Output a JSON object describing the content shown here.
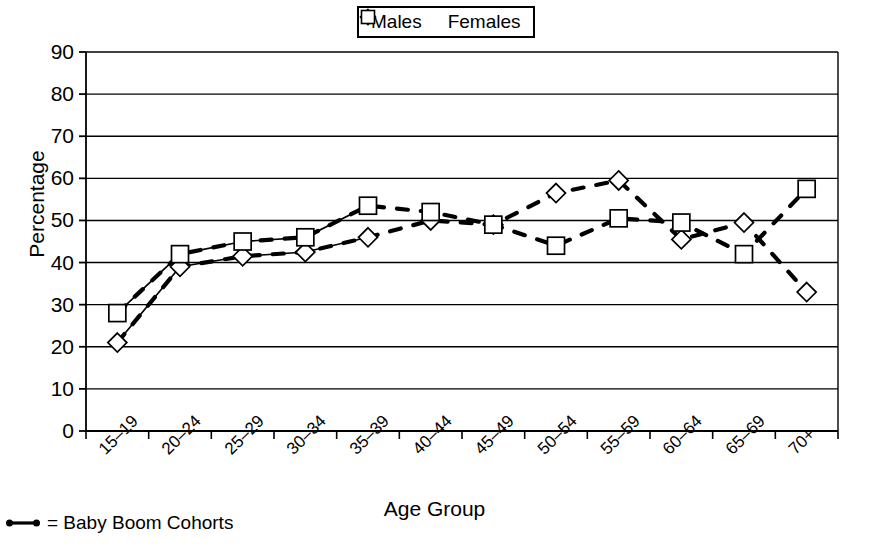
{
  "chart_data": {
    "type": "line",
    "title": "",
    "xlabel": "Age Group",
    "ylabel": "Percentage",
    "ylim": [
      0,
      90
    ],
    "yticks": [
      0,
      10,
      20,
      30,
      40,
      50,
      60,
      70,
      80,
      90
    ],
    "grid": true,
    "legend_position": "top-center",
    "categories": [
      "15–19",
      "20–24",
      "25–29",
      "30–34",
      "35–39",
      "40–44",
      "45–49",
      "50–54",
      "55–59",
      "60–64",
      "65–69",
      "70+"
    ],
    "series": [
      {
        "name": "Males",
        "marker": "diamond",
        "values": [
          21,
          39,
          41.5,
          42.5,
          46,
          50,
          49,
          56.5,
          59.5,
          45.5,
          49.5,
          33
        ]
      },
      {
        "name": "Females",
        "marker": "square",
        "values": [
          28,
          42,
          45,
          46,
          53.5,
          52,
          49,
          44,
          50.5,
          49.5,
          42,
          57.5
        ]
      }
    ],
    "solid_line_range": [
      0,
      4
    ],
    "dashed_line_note": "Baby Boom cohorts drawn with heavy dashed connector",
    "annotations": [
      {
        "text": "= Baby Boom Cohorts",
        "position": "below-axis-left"
      }
    ]
  },
  "legend": {
    "items": [
      {
        "label": "Males",
        "marker": "diamond"
      },
      {
        "label": "Females",
        "marker": "square"
      }
    ]
  },
  "footnote": {
    "text": "= Baby Boom Cohorts"
  },
  "axes": {
    "y_title": "Percentage",
    "x_title": "Age Group"
  }
}
